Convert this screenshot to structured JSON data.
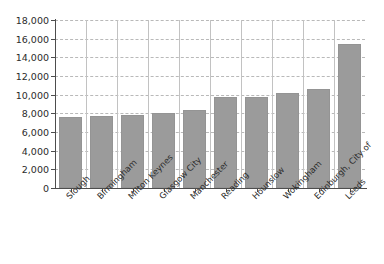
{
  "chart_data": {
    "type": "bar",
    "title": "",
    "subtitle": "",
    "xlabel": "",
    "ylabel": "",
    "categories": [
      "Slough",
      "Birmingham",
      "Milton Keynes",
      "Glasgow City",
      "Manchester",
      "Reading",
      "Hounslow",
      "Wokingham",
      "Edinburgh, City of",
      "Leeds"
    ],
    "values": [
      7650,
      7700,
      7820,
      8080,
      8340,
      9750,
      9800,
      10200,
      10600,
      15400
    ],
    "ylim": [
      0,
      18000
    ],
    "ytick_values": [
      0,
      2000,
      4000,
      6000,
      8000,
      10000,
      12000,
      14000,
      16000,
      18000
    ],
    "ytick_labels": [
      "0",
      "2,000",
      "4,000",
      "6,000",
      "8,000",
      "10,000",
      "12,000",
      "14,000",
      "16,000",
      "18,000"
    ],
    "grid": {
      "horizontal": true,
      "horizontal_style": "dashed",
      "vertical": true,
      "vertical_style": "solid"
    },
    "legend": {
      "visible": false,
      "position": "none",
      "entries": []
    },
    "colors": {
      "bar_fill": "#9b9b9b",
      "bar_edge": "#949494",
      "axis": "#4d4d4d",
      "hgrid": "#b9b9b9",
      "vgrid": "#c2c2c2",
      "text": "#2b2b2b",
      "background": "#ffffff"
    },
    "xlabel_rotation": -45
  }
}
